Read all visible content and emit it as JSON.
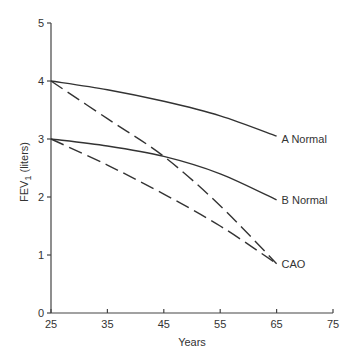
{
  "chart_data": {
    "type": "line",
    "title": "",
    "xlabel": "Years",
    "ylabel": "FEV1 (liters)",
    "ylabel_main": "FEV",
    "ylabel_sub": "1",
    "ylabel_unit": "(liters)",
    "xlim": [
      25,
      75
    ],
    "ylim": [
      0,
      5
    ],
    "xticks": [
      25,
      35,
      45,
      55,
      65,
      75
    ],
    "yticks": [
      0,
      1,
      2,
      3,
      4,
      5
    ],
    "grid": false,
    "legend": "inline labels at line ends",
    "series": [
      {
        "name": "A Normal",
        "style": "solid",
        "x": [
          25,
          35,
          45,
          55,
          65
        ],
        "y": [
          4.0,
          3.85,
          3.65,
          3.4,
          3.05
        ]
      },
      {
        "name": "B Normal",
        "style": "solid",
        "x": [
          25,
          35,
          45,
          55,
          65
        ],
        "y": [
          3.0,
          2.88,
          2.7,
          2.4,
          1.95
        ]
      },
      {
        "name": "CAO (from A)",
        "style": "dashed",
        "x": [
          25,
          35,
          45,
          55,
          65
        ],
        "y": [
          4.0,
          3.35,
          2.7,
          1.85,
          0.85
        ]
      },
      {
        "name": "CAO (from B)",
        "style": "dashed",
        "x": [
          25,
          35,
          45,
          55,
          65
        ],
        "y": [
          3.0,
          2.55,
          2.05,
          1.5,
          0.85
        ]
      }
    ],
    "annotations": [
      {
        "text": "A Normal",
        "x": 65,
        "y": 3.0
      },
      {
        "text": "B Normal",
        "x": 65,
        "y": 1.95
      },
      {
        "text": "CAO",
        "x": 65,
        "y": 0.85
      }
    ]
  }
}
